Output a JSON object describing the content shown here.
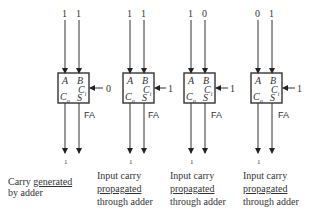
{
  "diagram": {
    "block_label": "FA",
    "adders": [
      {
        "a": "1",
        "b": "1",
        "cin": "0",
        "cout": "1",
        "pins": {
          "a": "A",
          "b": "B",
          "ci": "C",
          "ci_sub": "i",
          "co": "C",
          "co_sub": "o",
          "s": "S"
        },
        "caption": {
          "line1_pre": "Carry ",
          "line1_u": "generated",
          "line2": "by adder"
        }
      },
      {
        "a": "1",
        "b": "1",
        "cin": "1",
        "cout": "1",
        "pins": {
          "a": "A",
          "b": "B",
          "ci": "C",
          "ci_sub": "i",
          "co": "C",
          "co_sub": "o",
          "s": "S"
        },
        "caption": {
          "line1": "Input carry",
          "line2_u": "propagated",
          "line3": "through adder"
        }
      },
      {
        "a": "1",
        "b": "0",
        "cin": "1",
        "cout": "1",
        "pins": {
          "a": "A",
          "b": "B",
          "ci": "C",
          "ci_sub": "i",
          "co": "C",
          "co_sub": "o",
          "s": "S"
        },
        "caption": {
          "line1": "Input carry",
          "line2_u": "propagated",
          "line3": "through adder"
        }
      },
      {
        "a": "0",
        "b": "1",
        "cin": "1",
        "cout": "1",
        "pins": {
          "a": "A",
          "b": "B",
          "ci": "C",
          "ci_sub": "i",
          "co": "C",
          "co_sub": "o",
          "s": "S"
        },
        "caption": {
          "line1": "Input carry",
          "line2_u": "propagated",
          "line3": "through adder"
        }
      }
    ]
  }
}
